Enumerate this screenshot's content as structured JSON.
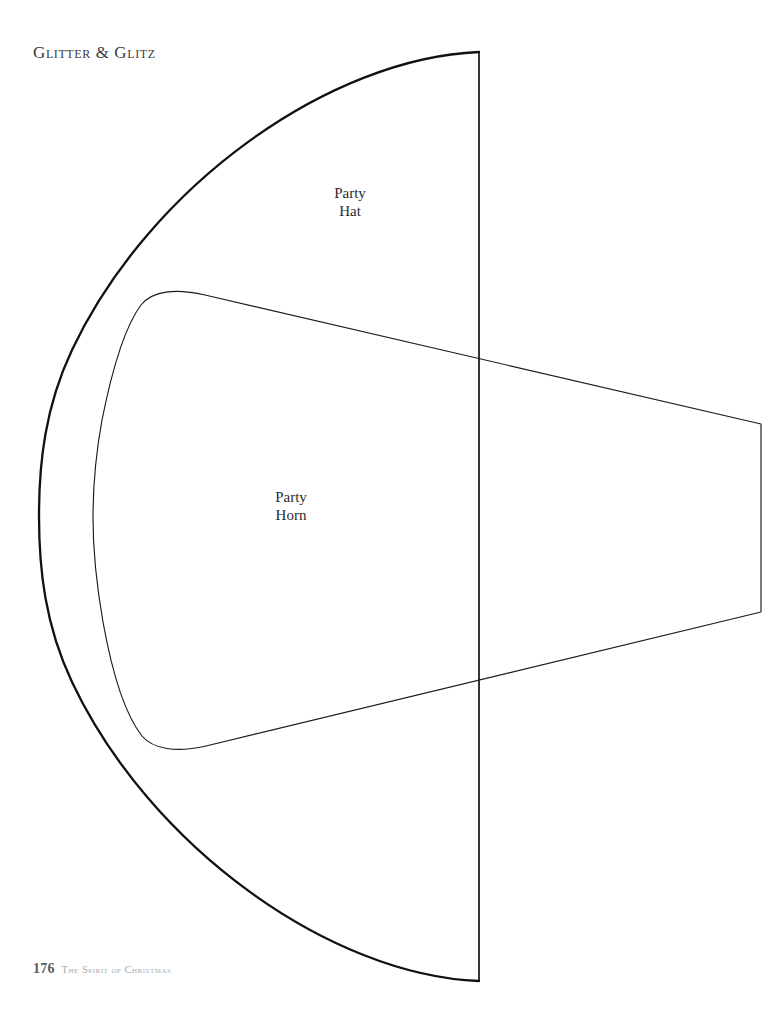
{
  "page": {
    "background_color": "#ffffff",
    "width": 783,
    "height": 1011
  },
  "running_head": {
    "text": "Glitter & Glitz"
  },
  "labels": {
    "party_hat": {
      "line1": "Party",
      "line2": "Hat"
    },
    "party_horn": {
      "line1": "Party",
      "line2": "Horn"
    }
  },
  "folio": {
    "page_number": "176",
    "book_title": "The Spirit of Christmas"
  },
  "artwork": {
    "description": "Full-page sewing/craft pattern: large quarter-round party hat template with an inner party horn template",
    "stroke_color": "#111114",
    "outer_arc_stroke_width": 2.3,
    "inner_shape_stroke_width": 1.2,
    "fold_line_stroke_width": 1.6,
    "shapes": {
      "party_hat_arc": {
        "name": "party-hat-arc",
        "chord_x": 479,
        "top_y": 52,
        "bottom_y": 981,
        "leftmost_x": 39
      },
      "fold_line": {
        "name": "fold-line",
        "x": 479,
        "y1": 52,
        "y2": 981
      },
      "party_horn_outline": {
        "name": "party-horn-outline",
        "left_corner_top": [
          140,
          289
        ],
        "left_bulge_x": 93,
        "left_corner_bottom": [
          146,
          750
        ],
        "right_top": [
          761,
          424
        ],
        "right_bottom": [
          761,
          612
        ],
        "crosses_fold_top_y": 357,
        "crosses_fold_bottom_y": 680
      }
    }
  }
}
